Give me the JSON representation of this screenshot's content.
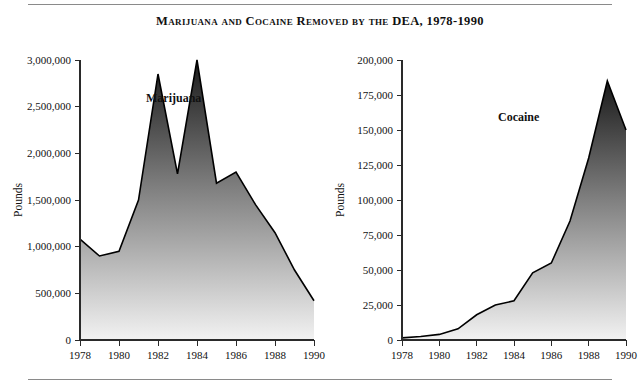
{
  "figure": {
    "title": "Marijuana and Cocaine Removed by the DEA, 1978-1990",
    "background_color": "#ffffff",
    "rule_color": "#8a8a8a"
  },
  "chart_data": [
    {
      "type": "area",
      "id": "marijuana",
      "title": "Marijuana",
      "series_label": "Marijuana",
      "xlabel": "",
      "ylabel": "Pounds",
      "x": [
        1978,
        1979,
        1980,
        1981,
        1982,
        1983,
        1984,
        1985,
        1986,
        1987,
        1988,
        1989,
        1990
      ],
      "values": [
        1080000,
        900000,
        950000,
        1500000,
        2850000,
        1780000,
        3000000,
        1680000,
        1800000,
        1450000,
        1150000,
        750000,
        420000
      ],
      "categories": [
        "1978",
        "1979",
        "1980",
        "1981",
        "1982",
        "1983",
        "1984",
        "1985",
        "1986",
        "1987",
        "1988",
        "1989",
        "1990"
      ],
      "xlim": [
        1978,
        1990
      ],
      "ylim": [
        0,
        3000000
      ],
      "ytick_values": [
        0,
        500000,
        1000000,
        1500000,
        2000000,
        2500000,
        3000000
      ],
      "ytick_labels": [
        "0",
        "500,000",
        "1,000,000",
        "1,500,000",
        "2,000,000",
        "2,500,000",
        "3,000,000"
      ],
      "xtick_values": [
        1978,
        1980,
        1982,
        1984,
        1986,
        1988,
        1990
      ],
      "xtick_labels": [
        "1978",
        "1980",
        "1982",
        "1984",
        "1986",
        "1988",
        "1990"
      ],
      "grid": false,
      "legend": "none",
      "fill_gradient": [
        "#f2f2f2",
        "#1a1a1a"
      ],
      "line_color": "#000000"
    },
    {
      "type": "area",
      "id": "cocaine",
      "title": "Cocaine",
      "series_label": "Cocaine",
      "xlabel": "",
      "ylabel": "Pounds",
      "x": [
        1978,
        1979,
        1980,
        1981,
        1982,
        1983,
        1984,
        1985,
        1986,
        1987,
        1988,
        1989,
        1990
      ],
      "values": [
        1500,
        2500,
        4000,
        8000,
        18000,
        25000,
        28000,
        48000,
        55000,
        85000,
        130000,
        185000,
        150000
      ],
      "categories": [
        "1978",
        "1979",
        "1980",
        "1981",
        "1982",
        "1983",
        "1984",
        "1985",
        "1986",
        "1987",
        "1988",
        "1989",
        "1990"
      ],
      "xlim": [
        1978,
        1990
      ],
      "ylim": [
        0,
        200000
      ],
      "ytick_values": [
        0,
        25000,
        50000,
        75000,
        100000,
        125000,
        150000,
        175000,
        200000
      ],
      "ytick_labels": [
        "0",
        "25,000",
        "50,000",
        "75,000",
        "100,000",
        "125,000",
        "150,000",
        "175,000",
        "200,000"
      ],
      "xtick_values": [
        1978,
        1980,
        1982,
        1984,
        1986,
        1988,
        1990
      ],
      "xtick_labels": [
        "1978",
        "1980",
        "1982",
        "1984",
        "1986",
        "1988",
        "1990"
      ],
      "grid": false,
      "legend": "none",
      "fill_gradient": [
        "#f2f2f2",
        "#1a1a1a"
      ],
      "line_color": "#000000"
    }
  ]
}
